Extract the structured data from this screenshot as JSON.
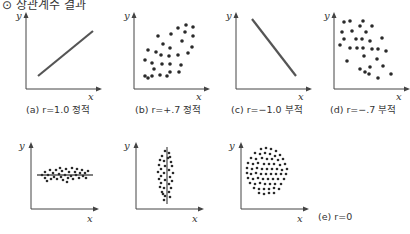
{
  "header": {
    "text": "⊙ 상관계수 결과"
  },
  "panels": [
    {
      "id": "a",
      "caption": "(a) r=1.0 정적",
      "kind": "line-positive",
      "x_label": "x",
      "y_label": "y"
    },
    {
      "id": "b",
      "caption": "(b) r=+.7 정적",
      "kind": "scatter-positive",
      "x_label": "x",
      "y_label": "y"
    },
    {
      "id": "c",
      "caption": "(c) r=−1.0 부적",
      "kind": "line-negative",
      "x_label": "x",
      "y_label": "y"
    },
    {
      "id": "d",
      "caption": "(d) r=−.7 부적",
      "kind": "scatter-negative",
      "x_label": "x",
      "y_label": "y"
    },
    {
      "id": "e1",
      "caption": "",
      "kind": "horizontal-band",
      "x_label": "x",
      "y_label": "y"
    },
    {
      "id": "e2",
      "caption": "",
      "kind": "vertical-band",
      "x_label": "x",
      "y_label": "y"
    },
    {
      "id": "e3",
      "caption": "",
      "kind": "circle-cloud",
      "x_label": "x",
      "y_label": "y"
    }
  ],
  "group_caption": "(e) r=0",
  "colors": {
    "ink": "#2a2a2a",
    "axis": "#444444"
  }
}
